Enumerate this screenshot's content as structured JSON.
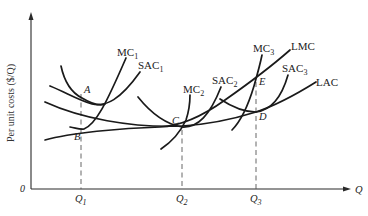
{
  "diagram": {
    "y_axis_label": "Per unit costs ($/Q)",
    "x_axis_label": "Q",
    "origin_label": "0",
    "ticks": [
      {
        "base": "Q",
        "sub": "1"
      },
      {
        "base": "Q",
        "sub": "2"
      },
      {
        "base": "Q",
        "sub": "3"
      }
    ],
    "curves": {
      "mc1": {
        "base": "MC",
        "sub": "1"
      },
      "sac1": {
        "base": "SAC",
        "sub": "1"
      },
      "mc2": {
        "base": "MC",
        "sub": "2"
      },
      "sac2": {
        "base": "SAC",
        "sub": "2"
      },
      "mc3": {
        "base": "MC",
        "sub": "3"
      },
      "sac3": {
        "base": "SAC",
        "sub": "3"
      },
      "lmc": {
        "base": "LMC"
      },
      "lac": {
        "base": "LAC"
      }
    },
    "points": {
      "a": "A",
      "b": "B",
      "c": "C",
      "d": "D",
      "e": "E"
    }
  }
}
